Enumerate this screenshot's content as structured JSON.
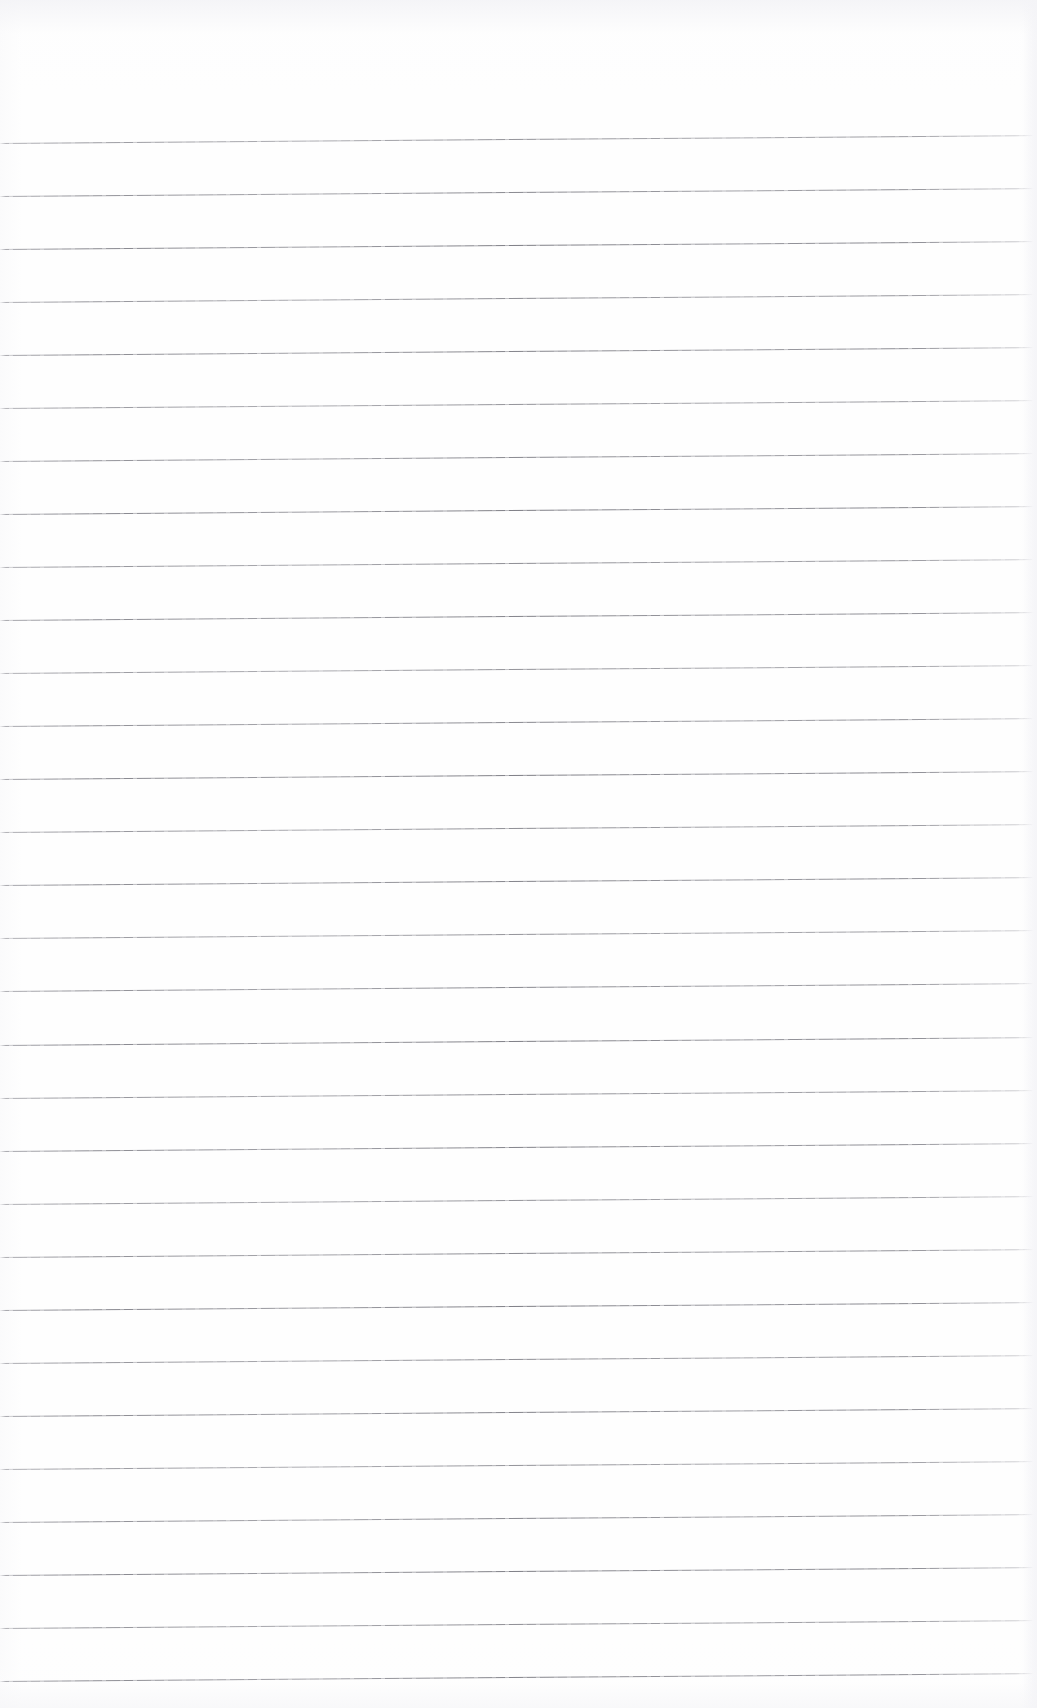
{
  "page": {
    "kind": "scanned-blank-lined-notebook-page",
    "width_px": 1037,
    "height_px": 1708,
    "background_color": "#fefefe",
    "has_visible_text": false,
    "has_handwriting": false,
    "has_margin_rule": false,
    "alt_text": "Blank scanned notebook page with horizontal ruled lines and no writing"
  },
  "ruling": {
    "line_count": 30,
    "first_line_y": 143,
    "last_line_y": 1681,
    "line_spacing_px": 53.03,
    "line_thickness_px": 1,
    "line_color": "#84848c",
    "line_start_x": 0,
    "line_end_x": 1034,
    "skew_rise_px": 8,
    "skew_degrees": -0.44,
    "top_margin_px": 143,
    "bottom_margin_px": 27
  },
  "artifacts": {
    "scan_noise_color": "#f4f4f7",
    "right_edge_shade_color": "#f4f4f7",
    "edge_fade": true
  }
}
